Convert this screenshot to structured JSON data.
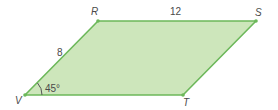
{
  "diagram": {
    "shape": "parallelogram",
    "fill": "#cde6bb",
    "stroke": "#6cb85a",
    "vertices": {
      "V": {
        "label": "V",
        "x": 25,
        "y": 95
      },
      "R": {
        "label": "R",
        "x": 98,
        "y": 21
      },
      "S": {
        "label": "S",
        "x": 256,
        "y": 21
      },
      "T": {
        "label": "T",
        "x": 183,
        "y": 95
      }
    },
    "side_labels": {
      "VR": "8",
      "RS": "12"
    },
    "angle_label": "45°"
  }
}
